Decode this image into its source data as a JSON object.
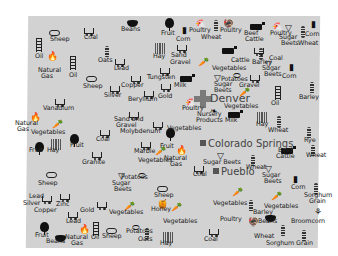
{
  "map": {
    "region": "Colorado",
    "background": "#d2d2d2",
    "cities": [
      {
        "name": "Denver",
        "x": 212,
        "y": 94,
        "marker": "cross"
      },
      {
        "name": "Colorado Springs",
        "x": 205,
        "y": 139,
        "marker": "square"
      },
      {
        "name": "Pueblo",
        "x": 216,
        "y": 168,
        "marker": "square"
      }
    ],
    "labels": [
      {
        "text": "Sheep",
        "x": 52,
        "y": 40
      },
      {
        "text": "Coal",
        "x": 86,
        "y": 38
      },
      {
        "text": "Beans",
        "x": 123,
        "y": 30
      },
      {
        "text": "Fruit",
        "x": 163,
        "y": 34
      },
      {
        "text": "Corn",
        "x": 178,
        "y": 40
      },
      {
        "text": "Poultry",
        "x": 191,
        "y": 31
      },
      {
        "text": "Wheat",
        "x": 203,
        "y": 38
      },
      {
        "text": "Poultry",
        "x": 222,
        "y": 31
      },
      {
        "text": "Beef",
        "x": 246,
        "y": 34
      },
      {
        "text": "Cattle",
        "x": 247,
        "y": 40
      },
      {
        "text": "Poultry",
        "x": 272,
        "y": 34
      },
      {
        "text": "Sugar",
        "x": 281,
        "y": 38
      },
      {
        "text": "Beets",
        "x": 283,
        "y": 44
      },
      {
        "text": "Corn",
        "x": 307,
        "y": 35
      },
      {
        "text": "Wheat",
        "x": 300,
        "y": 44
      },
      {
        "text": "Oil",
        "x": 37,
        "y": 57
      },
      {
        "text": "Oats",
        "x": 100,
        "y": 61
      },
      {
        "text": "Lead",
        "x": 116,
        "y": 69
      },
      {
        "text": "Hay",
        "x": 155,
        "y": 57
      },
      {
        "text": "Sand",
        "x": 173,
        "y": 56
      },
      {
        "text": "Gravel",
        "x": 172,
        "y": 63
      },
      {
        "text": "Cattle",
        "x": 233,
        "y": 61
      },
      {
        "text": "Barley",
        "x": 254,
        "y": 63
      },
      {
        "text": "Coal",
        "x": 271,
        "y": 59
      },
      {
        "text": "Sugar",
        "x": 264,
        "y": 69
      },
      {
        "text": "Beets",
        "x": 266,
        "y": 75
      },
      {
        "text": "Corn",
        "x": 284,
        "y": 77
      },
      {
        "text": "Vegetables",
        "x": 214,
        "y": 69
      },
      {
        "text": "Natural",
        "x": 40,
        "y": 71
      },
      {
        "text": "Gas",
        "x": 43,
        "y": 77
      },
      {
        "text": "Oil",
        "x": 71,
        "y": 76
      },
      {
        "text": "Sheep",
        "x": 85,
        "y": 87
      },
      {
        "text": "Copper",
        "x": 123,
        "y": 86
      },
      {
        "text": "Tungsten",
        "x": 149,
        "y": 78
      },
      {
        "text": "Potatoes",
        "x": 223,
        "y": 80
      },
      {
        "text": "Silver",
        "x": 106,
        "y": 96
      },
      {
        "text": "Gold",
        "x": 160,
        "y": 97
      },
      {
        "text": "Milk",
        "x": 176,
        "y": 86
      },
      {
        "text": "Sugar",
        "x": 216,
        "y": 85
      },
      {
        "text": "Beets",
        "x": 216,
        "y": 91
      },
      {
        "text": "Gravel",
        "x": 241,
        "y": 86
      },
      {
        "text": "Oil",
        "x": 273,
        "y": 104
      },
      {
        "text": "Barley",
        "x": 301,
        "y": 98
      },
      {
        "text": "Beryllium",
        "x": 130,
        "y": 100
      },
      {
        "text": "Vanadium",
        "x": 45,
        "y": 109
      },
      {
        "text": "Poultry",
        "x": 184,
        "y": 109
      },
      {
        "text": "Vegetables",
        "x": 226,
        "y": 107
      },
      {
        "text": "Nursery",
        "x": 199,
        "y": 115
      },
      {
        "text": "Products",
        "x": 198,
        "y": 121
      },
      {
        "text": "Milk",
        "x": 227,
        "y": 121
      },
      {
        "text": "Hay",
        "x": 258,
        "y": 125
      },
      {
        "text": "Wheat",
        "x": 270,
        "y": 131
      },
      {
        "text": "Natural",
        "x": 17,
        "y": 124
      },
      {
        "text": "Gas",
        "x": 19,
        "y": 130
      },
      {
        "text": "Sand and",
        "x": 116,
        "y": 120
      },
      {
        "text": "Gravel",
        "x": 118,
        "y": 126
      },
      {
        "text": "Molybdenum",
        "x": 122,
        "y": 132
      },
      {
        "text": "Vegetables",
        "x": 33,
        "y": 133
      },
      {
        "text": "Coal",
        "x": 98,
        "y": 140
      },
      {
        "text": "Vegetables",
        "x": 169,
        "y": 129
      },
      {
        "text": "Rye",
        "x": 306,
        "y": 141
      },
      {
        "text": "Fruit",
        "x": 31,
        "y": 151
      },
      {
        "text": "Hay",
        "x": 49,
        "y": 151
      },
      {
        "text": "Fruit",
        "x": 72,
        "y": 146
      },
      {
        "text": "Granite",
        "x": 84,
        "y": 163
      },
      {
        "text": "Fruit",
        "x": 162,
        "y": 147
      },
      {
        "text": "Natural",
        "x": 166,
        "y": 159
      },
      {
        "text": "Gas",
        "x": 172,
        "y": 165
      },
      {
        "text": "Marble",
        "x": 136,
        "y": 152
      },
      {
        "text": "Vegetables",
        "x": 140,
        "y": 161
      },
      {
        "text": "Beef",
        "x": 280,
        "y": 151
      },
      {
        "text": "Cattle",
        "x": 278,
        "y": 157
      },
      {
        "text": "Wheat",
        "x": 308,
        "y": 156
      },
      {
        "text": "Sugar Beets",
        "x": 205,
        "y": 163
      },
      {
        "text": "Wheat",
        "x": 248,
        "y": 168
      },
      {
        "text": "Coal",
        "x": 195,
        "y": 175
      },
      {
        "text": "Potatoes",
        "x": 123,
        "y": 178
      },
      {
        "text": "Sugar",
        "x": 114,
        "y": 184
      },
      {
        "text": "Beets",
        "x": 116,
        "y": 190
      },
      {
        "text": "Sheep",
        "x": 156,
        "y": 196
      },
      {
        "text": "Sheep",
        "x": 40,
        "y": 184
      },
      {
        "text": "Sugar",
        "x": 264,
        "y": 176
      },
      {
        "text": "Beets",
        "x": 266,
        "y": 182
      },
      {
        "text": "Corn",
        "x": 293,
        "y": 188
      },
      {
        "text": "Sorghum",
        "x": 306,
        "y": 196
      },
      {
        "text": "Grain",
        "x": 311,
        "y": 202
      },
      {
        "text": "Lead",
        "x": 31,
        "y": 197
      },
      {
        "text": "Silver",
        "x": 25,
        "y": 204
      },
      {
        "text": "Zinc",
        "x": 58,
        "y": 205
      },
      {
        "text": "Copper",
        "x": 36,
        "y": 211
      },
      {
        "text": "Vegetables",
        "x": 215,
        "y": 204
      },
      {
        "text": "Vegetables",
        "x": 266,
        "y": 207
      },
      {
        "text": "Gold",
        "x": 82,
        "y": 211
      },
      {
        "text": "Vegetables",
        "x": 111,
        "y": 213
      },
      {
        "text": "Honey",
        "x": 153,
        "y": 210
      },
      {
        "text": "Barley",
        "x": 255,
        "y": 213
      },
      {
        "text": "Lead",
        "x": 68,
        "y": 222
      },
      {
        "text": "Vegetables",
        "x": 165,
        "y": 222
      },
      {
        "text": "Poultry",
        "x": 222,
        "y": 220
      },
      {
        "text": "Beans",
        "x": 260,
        "y": 222
      },
      {
        "text": "Broomcorn",
        "x": 293,
        "y": 222
      },
      {
        "text": "Fruit",
        "x": 37,
        "y": 236
      },
      {
        "text": "Beans",
        "x": 48,
        "y": 242
      },
      {
        "text": "Natural",
        "x": 67,
        "y": 238
      },
      {
        "text": "Gas",
        "x": 73,
        "y": 244
      },
      {
        "text": "Oil",
        "x": 93,
        "y": 238
      },
      {
        "text": "Sheep",
        "x": 104,
        "y": 237
      },
      {
        "text": "Potatoes",
        "x": 128,
        "y": 232
      },
      {
        "text": "Oats",
        "x": 140,
        "y": 240
      },
      {
        "text": "Hay",
        "x": 162,
        "y": 244
      },
      {
        "text": "Coal",
        "x": 206,
        "y": 240
      },
      {
        "text": "Wheat",
        "x": 256,
        "y": 237
      },
      {
        "text": "Sorghum Grain",
        "x": 268,
        "y": 244
      }
    ]
  }
}
